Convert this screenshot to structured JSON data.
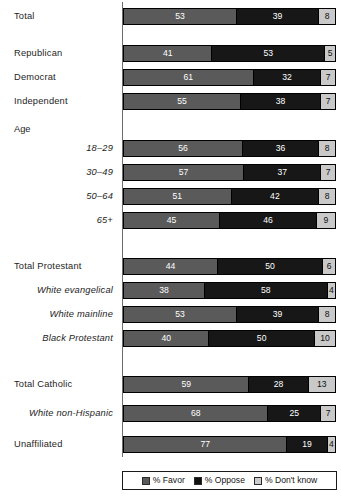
{
  "chart_data": {
    "type": "bar",
    "subtype": "stacked-horizontal-100",
    "title": "",
    "xlabel": "",
    "ylabel": "",
    "xlim": [
      0,
      100
    ],
    "grid": false,
    "legend_position": "bottom",
    "series": [
      {
        "name": "% Favor",
        "key": "favor",
        "color": "#5a5a5a"
      },
      {
        "name": "% Oppose",
        "key": "oppose",
        "color": "#171717"
      },
      {
        "name": "% Don't know",
        "key": "dk",
        "color": "#c9c9c9"
      }
    ],
    "categories": [
      "Total",
      "Republican",
      "Democrat",
      "Independent",
      "18–29",
      "30–49",
      "50–64",
      "65+",
      "Total Protestant",
      "White evangelical",
      "White mainline",
      "Black Protestant",
      "Total Catholic",
      "White non-Hispanic",
      "Unaffiliated"
    ],
    "group_headers": [
      "Age"
    ],
    "values": {
      "favor": [
        53,
        41,
        61,
        55,
        56,
        57,
        51,
        45,
        44,
        38,
        53,
        40,
        59,
        68,
        77
      ],
      "oppose": [
        39,
        53,
        32,
        38,
        36,
        37,
        42,
        46,
        50,
        58,
        39,
        50,
        28,
        25,
        19
      ],
      "dk": [
        8,
        5,
        7,
        7,
        8,
        7,
        8,
        9,
        6,
        4,
        8,
        10,
        13,
        7,
        4
      ]
    }
  },
  "rows": [
    {
      "label": "Total",
      "style": "top",
      "y": 8,
      "favor": 53,
      "oppose": 39,
      "dk": 8
    },
    {
      "label": "Republican",
      "style": "top",
      "y": 45,
      "favor": 41,
      "oppose": 53,
      "dk": 5
    },
    {
      "label": "Democrat",
      "style": "top",
      "y": 69,
      "favor": 61,
      "oppose": 32,
      "dk": 7
    },
    {
      "label": "Independent",
      "style": "top",
      "y": 93,
      "favor": 55,
      "oppose": 38,
      "dk": 7
    },
    {
      "label": "18–29",
      "style": "sub",
      "y": 140,
      "favor": 56,
      "oppose": 36,
      "dk": 8
    },
    {
      "label": "30–49",
      "style": "sub",
      "y": 164,
      "favor": 57,
      "oppose": 37,
      "dk": 7
    },
    {
      "label": "50–64",
      "style": "sub",
      "y": 188,
      "favor": 51,
      "oppose": 42,
      "dk": 8
    },
    {
      "label": "65+",
      "style": "sub",
      "y": 212,
      "favor": 45,
      "oppose": 46,
      "dk": 9
    },
    {
      "label": "Total Protestant",
      "style": "top",
      "y": 258,
      "favor": 44,
      "oppose": 50,
      "dk": 6
    },
    {
      "label": "White evangelical",
      "style": "sub",
      "y": 282,
      "favor": 38,
      "oppose": 58,
      "dk": 4
    },
    {
      "label": "White mainline",
      "style": "sub",
      "y": 306,
      "favor": 53,
      "oppose": 39,
      "dk": 8
    },
    {
      "label": "Black Protestant",
      "style": "sub",
      "y": 330,
      "favor": 40,
      "oppose": 50,
      "dk": 10
    },
    {
      "label": "Total Catholic",
      "style": "top",
      "y": 376,
      "favor": 59,
      "oppose": 28,
      "dk": 13
    },
    {
      "label": "White non-Hispanic",
      "style": "sub",
      "y": 405,
      "favor": 68,
      "oppose": 25,
      "dk": 7
    },
    {
      "label": "Unaffiliated",
      "style": "top",
      "y": 436,
      "favor": 77,
      "oppose": 19,
      "dk": 4
    }
  ],
  "group_headers": [
    {
      "text": "Age",
      "y": 124
    }
  ],
  "legend": {
    "items": [
      {
        "label": "% Favor",
        "swatch": "favor"
      },
      {
        "label": "% Oppose",
        "swatch": "oppose"
      },
      {
        "label": "% Don't know",
        "swatch": "dk"
      }
    ]
  }
}
